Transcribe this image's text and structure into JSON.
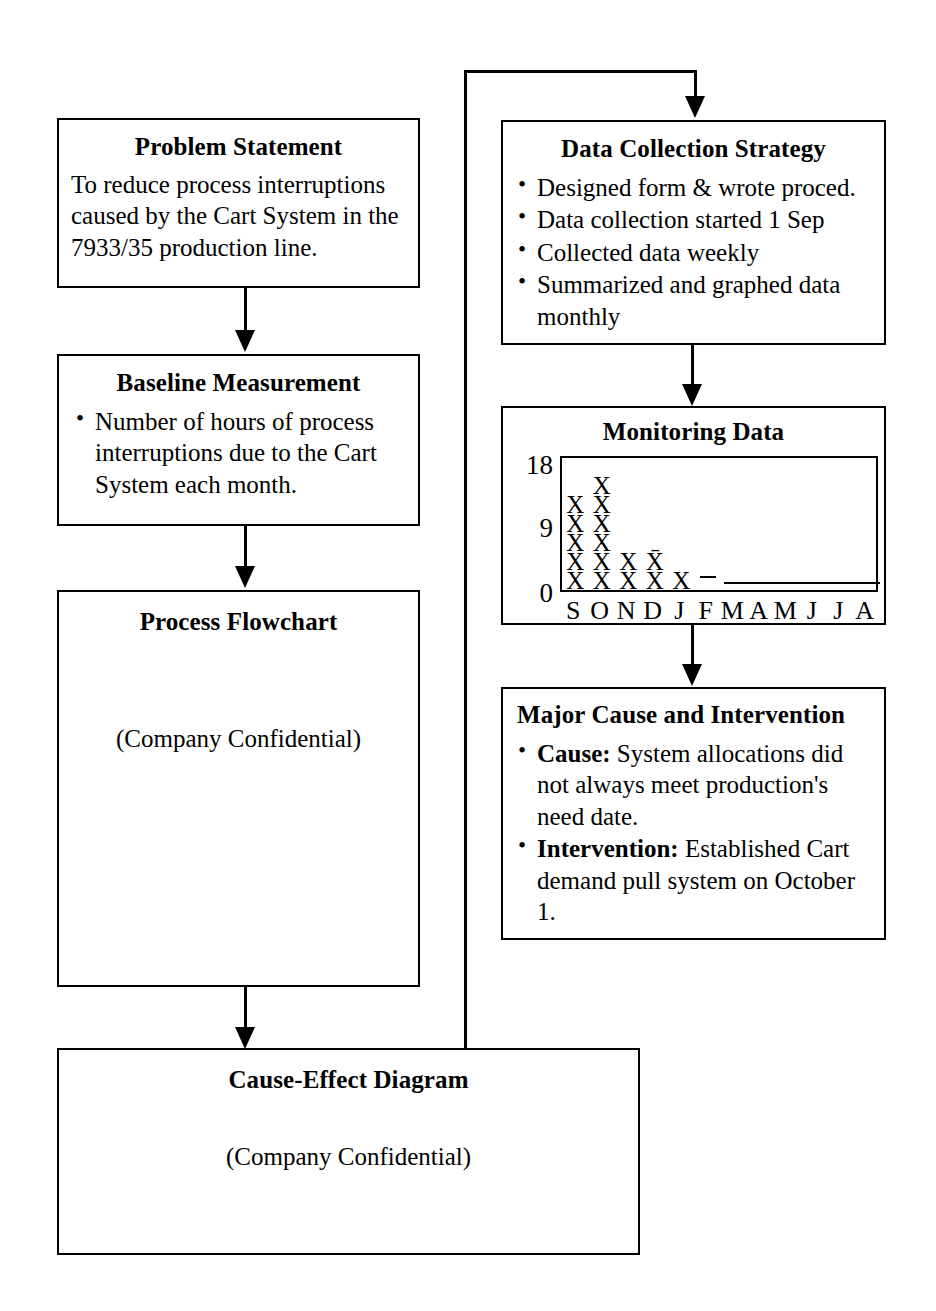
{
  "boxes": {
    "problem_statement": {
      "title": "Problem Statement",
      "body": "To reduce process interruptions caused by the Cart System in the 7933/35 production line."
    },
    "baseline_measurement": {
      "title": "Baseline Measurement",
      "bullets": [
        "Number of hours of process interruptions due to the Cart System each month."
      ]
    },
    "process_flowchart": {
      "title": "Process Flowchart",
      "note": "(Company Confidential)"
    },
    "cause_effect_diagram": {
      "title": "Cause-Effect Diagram",
      "note": "(Company Confidential)"
    },
    "data_collection_strategy": {
      "title": "Data Collection Strategy",
      "bullets": [
        "Designed form & wrote proced.",
        "Data collection started 1 Sep",
        "Collected data weekly",
        "Summarized and graphed data monthly"
      ]
    },
    "monitoring_data": {
      "title": "Monitoring Data"
    },
    "major_cause": {
      "title": "Major Cause and Intervention",
      "bullets": [
        {
          "label": "Cause:",
          "text": " System allocations did not always meet production's need date."
        },
        {
          "label": "Intervention:",
          "text": " Established Cart demand pull system on October 1."
        }
      ]
    }
  },
  "chart_data": {
    "type": "bar",
    "title": "Monitoring Data",
    "xlabel": "",
    "ylabel": "",
    "ylim": [
      0,
      18
    ],
    "yticks": [
      0,
      9,
      18
    ],
    "grid": false,
    "legend": false,
    "marker": "X",
    "mean_marker": "X̄",
    "note": "Each X glyph represents one unit; stacked vertically per month. A short dash marks February and a flat baseline rule spans March through August at zero.",
    "categories": [
      "S",
      "O",
      "N",
      "D",
      "J",
      "F",
      "M",
      "A",
      "M",
      "J",
      "J",
      "A"
    ],
    "values": [
      5,
      6,
      2,
      2,
      1,
      0,
      0,
      0,
      0,
      0,
      0,
      0
    ],
    "mean_marked_index": 3,
    "dash_index": 5,
    "baseline_rule_from_index": 6,
    "baseline_rule_to_index": 11
  }
}
